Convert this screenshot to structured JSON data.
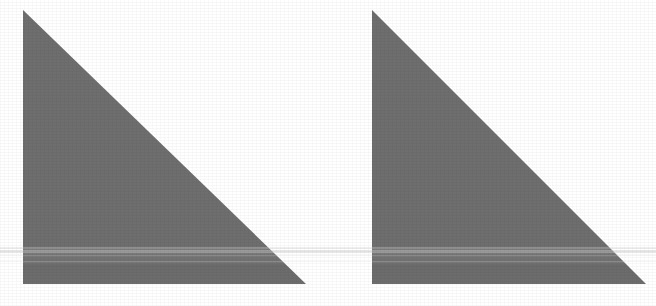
{
  "scene": {
    "title": "Two gray right triangles on white background",
    "width": 656,
    "height": 306,
    "background_color": "#ffffff",
    "caption": ""
  },
  "palette": {
    "triangle_fill": "#6e6e6e",
    "triangle_fill_band": "#757575",
    "background": "#ffffff",
    "scan_streak": "#c9c9c9",
    "edge_antialias": "#8d8d8d"
  },
  "shapes": [
    {
      "name": "left-triangle",
      "label": "Left right-triangle",
      "type": "right-triangle",
      "fill": "#6e6e6e",
      "orientation": "right angle at bottom-left",
      "vertices": [
        {
          "label": "apex",
          "x": 23,
          "y": 10
        },
        {
          "label": "bottom-left",
          "x": 23,
          "y": 284
        },
        {
          "label": "bottom-right",
          "x": 306,
          "y": 284
        }
      ],
      "width": 283,
      "height": 274
    },
    {
      "name": "right-triangle",
      "label": "Right right-triangle",
      "type": "right-triangle",
      "fill": "#6e6e6e",
      "orientation": "right angle at bottom-left",
      "vertices": [
        {
          "label": "apex",
          "x": 372,
          "y": 10
        },
        {
          "label": "bottom-left",
          "x": 372,
          "y": 284
        },
        {
          "label": "bottom-right",
          "x": 646,
          "y": 284
        }
      ],
      "width": 274,
      "height": 274
    }
  ],
  "artifacts": {
    "name": "scan-banding",
    "label": "Horizontal scanner banding",
    "color": "#c9c9c9",
    "bands": [
      {
        "y": 247,
        "height": 2,
        "opacity": 0.3
      },
      {
        "y": 250,
        "height": 3,
        "opacity": 0.42
      },
      {
        "y": 255,
        "height": 1,
        "opacity": 0.22
      },
      {
        "y": 261,
        "height": 1,
        "opacity": 0.18
      }
    ]
  }
}
